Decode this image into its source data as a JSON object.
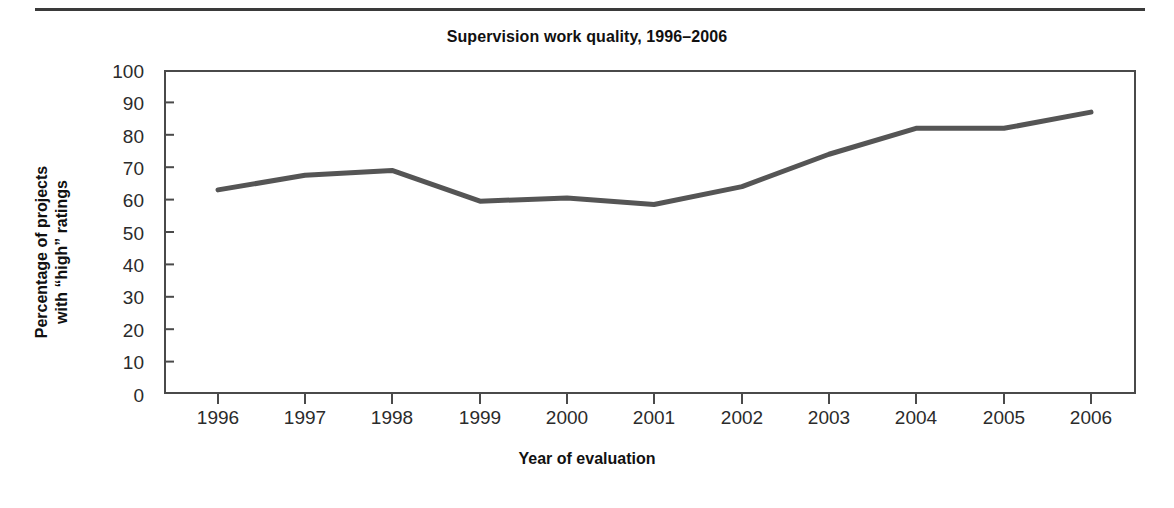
{
  "chart_data": {
    "type": "line",
    "title": "Supervision work quality, 1996–2006",
    "xlabel": "Year of evaluation",
    "ylabel_line1": "Percentage of projects",
    "ylabel_line2": "with “high” ratings",
    "categories": [
      "1996",
      "1997",
      "1998",
      "1999",
      "2000",
      "2001",
      "2002",
      "2003",
      "2004",
      "2005",
      "2006"
    ],
    "values": [
      63,
      67.5,
      69,
      59.5,
      60.5,
      58.5,
      64,
      74,
      82,
      82,
      87
    ],
    "series": [
      {
        "name": "Percentage of projects with “high” ratings",
        "values": [
          63,
          67.5,
          69,
          59.5,
          60.5,
          58.5,
          64,
          74,
          82,
          82,
          87
        ]
      }
    ],
    "ylim": [
      0,
      100
    ],
    "ytick_labels": [
      "100",
      "90",
      "80",
      "70",
      "60",
      "50",
      "40",
      "30",
      "20",
      "10",
      "0"
    ],
    "ytick_values": [
      100,
      90,
      80,
      70,
      60,
      50,
      40,
      30,
      20,
      10,
      0
    ],
    "grid": false,
    "legend": "none",
    "line_color": "#555555",
    "axis_color": "#4a4a4a",
    "background_color": "#ffffff",
    "rule_color": "#3a3a3a"
  }
}
